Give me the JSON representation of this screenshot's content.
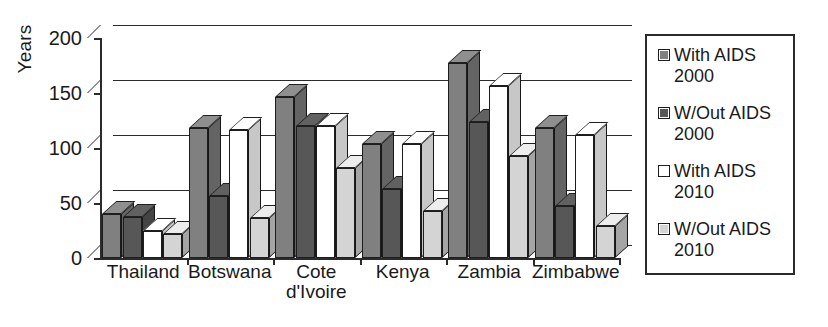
{
  "chart_data": {
    "type": "bar",
    "title": "",
    "xlabel": "",
    "ylabel": "Years",
    "ylim": [
      0,
      200
    ],
    "yticks": [
      0,
      50,
      100,
      150,
      200
    ],
    "grid": true,
    "legend_position": "right",
    "categories": [
      "Thailand",
      "Botswana",
      "Cote\nd'Ivoire",
      "Kenya",
      "Zambia",
      "Zimbabwe"
    ],
    "series": [
      {
        "name": "With AIDS\n2000",
        "values": [
          40,
          118,
          146,
          104,
          177,
          118
        ],
        "color": "#808080"
      },
      {
        "name": "W/Out AIDS\n2000",
        "values": [
          37,
          56,
          120,
          63,
          124,
          47
        ],
        "color": "#575757"
      },
      {
        "name": "With AIDS\n2010",
        "values": [
          25,
          116,
          120,
          104,
          156,
          112
        ],
        "color": "#ffffff"
      },
      {
        "name": "W/Out AIDS\n2010",
        "values": [
          22,
          36,
          82,
          43,
          93,
          29
        ],
        "color": "#d4d4d4"
      }
    ]
  },
  "legend": {
    "items": [
      {
        "label": "With AIDS\n2000",
        "swatch": "legend-swatch-with-aids-2000"
      },
      {
        "label": "W/Out AIDS\n2000",
        "swatch": "legend-swatch-without-aids-2000"
      },
      {
        "label": "With AIDS\n2010",
        "swatch": "legend-swatch-with-aids-2010"
      },
      {
        "label": "W/Out AIDS\n2010",
        "swatch": "legend-swatch-without-aids-2010"
      }
    ]
  },
  "axis": {
    "y_label": "Years",
    "y_tick_labels": [
      "200",
      "150",
      "100",
      "50",
      "0"
    ]
  }
}
